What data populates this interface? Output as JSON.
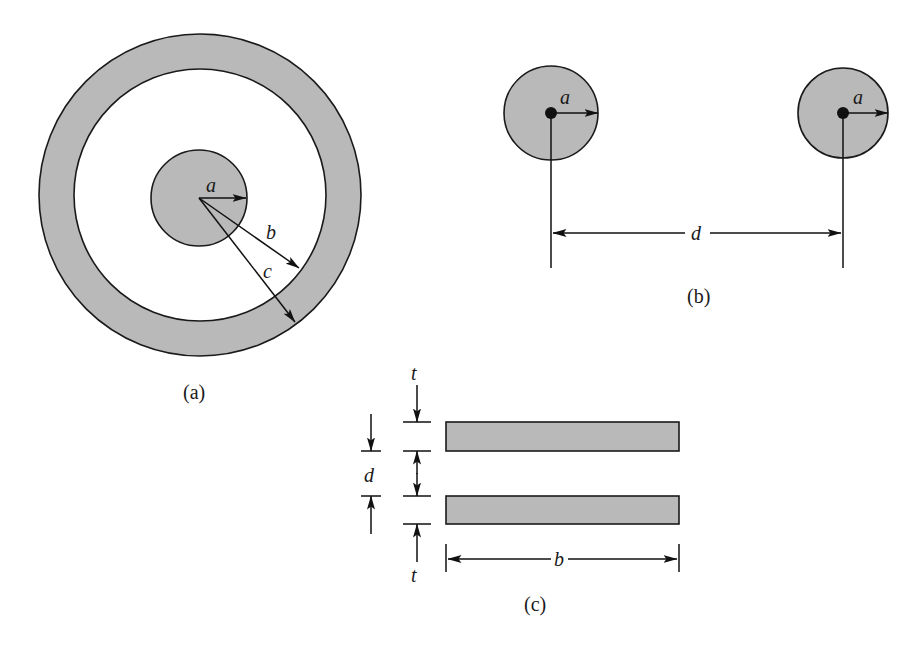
{
  "colors": {
    "fill": "#b9b9b9",
    "stroke": "#1a1a1a",
    "background": "#ffffff"
  },
  "figures": {
    "a": {
      "caption": "(a)",
      "description": "Coaxial cable cross-section",
      "labels": {
        "inner_radius": "a",
        "outer_inner_radius": "b",
        "outer_outer_radius": "c"
      }
    },
    "b": {
      "caption": "(b)",
      "description": "Two-wire line",
      "labels": {
        "left_radius": "a",
        "right_radius": "a",
        "separation": "d"
      }
    },
    "c": {
      "caption": "(c)",
      "description": "Parallel-plate line",
      "labels": {
        "top_thickness": "t",
        "bottom_thickness": "t",
        "separation": "d",
        "width": "b"
      }
    }
  }
}
